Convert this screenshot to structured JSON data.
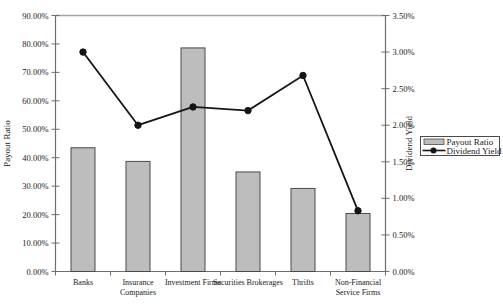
{
  "window": {
    "background": "#ffffff"
  },
  "chart_data": {
    "type": "bar",
    "subtype": "combo-bar-line-dual-axis",
    "title": "",
    "categories": [
      "Banks",
      "Insurance\nCompanies",
      "Investment Firms",
      "Securities Brokerages",
      "Thrifts",
      "Non-Financial\nService Firms"
    ],
    "series": [
      {
        "name": "Payout Ratio",
        "type": "bar",
        "axis": "left",
        "values": [
          43.5,
          38.7,
          78.6,
          35.0,
          29.2,
          20.4
        ]
      },
      {
        "name": "Dividend Yield",
        "type": "line",
        "axis": "right",
        "values": [
          3.0,
          2.0,
          2.25,
          2.2,
          2.68,
          0.83
        ]
      }
    ],
    "left_axis": {
      "label": "Payout Ratio",
      "min": 0,
      "max": 90,
      "step": 10,
      "tick_format": "0.00%"
    },
    "right_axis": {
      "label": "Dividend Yield",
      "min": 0,
      "max": 3.5,
      "step": 0.5,
      "tick_format": "0.00%"
    },
    "legend": {
      "position": "right",
      "entries": [
        "Payout Ratio",
        "Dividend Yield"
      ]
    },
    "grid": false,
    "colors": {
      "bar_fill": "#bdbdbd",
      "bar_border": "#4a4a4a",
      "line": "#151515",
      "marker": "#151515",
      "axis": "#6e6e6e",
      "top_border": "#a3a3a3",
      "text": "#1a1a1a",
      "legend_border": "#4a4a4a",
      "legend_fill": "#ffffff"
    }
  }
}
